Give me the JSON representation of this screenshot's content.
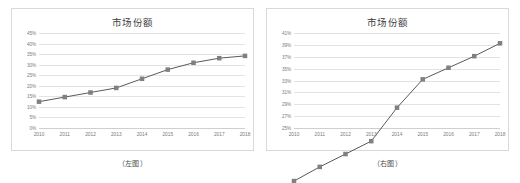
{
  "figures": [
    {
      "key": "left",
      "title": "市场份额",
      "caption": "（左图）",
      "line_color": "#595959",
      "marker_color": "#808080",
      "grid_color": "#e3e3e3",
      "chart_data": {
        "type": "line",
        "title": "市场份额",
        "xlabel": "",
        "ylabel": "",
        "categories": [
          "2010",
          "2011",
          "2012",
          "2013",
          "2014",
          "2015",
          "2016",
          "2017",
          "2018"
        ],
        "x": [
          2010,
          2011,
          2012,
          2013,
          2014,
          2015,
          2016,
          2017,
          2018
        ],
        "values": [
          30,
          31,
          32,
          33,
          35,
          37,
          38.5,
          39.5,
          40
        ],
        "ytick_labels": [
          "45%",
          "40%",
          "35%",
          "30%",
          "25%",
          "20%",
          "15%",
          "10%",
          "5%",
          "0%"
        ],
        "ytick_values": [
          45,
          40,
          35,
          30,
          25,
          20,
          15,
          10,
          5,
          0
        ],
        "ylim": [
          0,
          45
        ],
        "grid": true,
        "legend": "none",
        "marker": "square"
      }
    },
    {
      "key": "right",
      "title": "市场份额",
      "caption": "（右图）",
      "line_color": "#595959",
      "marker_color": "#808080",
      "grid_color": "#e3e3e3",
      "chart_data": {
        "type": "line",
        "title": "市场份额",
        "xlabel": "",
        "ylabel": "",
        "categories": [
          "2010",
          "2011",
          "2012",
          "2013",
          "2014",
          "2015",
          "2016",
          "2017",
          "2018"
        ],
        "x": [
          2010,
          2011,
          2012,
          2013,
          2014,
          2015,
          2016,
          2017,
          2018
        ],
        "values": [
          29.5,
          30.6,
          31.6,
          32.6,
          35.2,
          37.4,
          38.3,
          39.2,
          40.2
        ],
        "ytick_labels": [
          "41%",
          "39%",
          "37%",
          "35%",
          "33%",
          "31%",
          "29%",
          "27%",
          "25%"
        ],
        "ytick_values": [
          41,
          39,
          37,
          35,
          33,
          31,
          29,
          27,
          25
        ],
        "ylim": [
          25,
          41
        ],
        "grid": true,
        "legend": "none",
        "marker": "square"
      }
    }
  ]
}
